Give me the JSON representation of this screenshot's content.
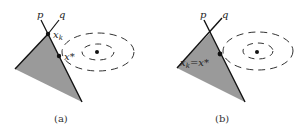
{
  "panels": [
    {
      "caption": "(a)",
      "labels": {
        "p": "p",
        "q": "q",
        "xk": "x",
        "xk_sub": "k",
        "xstar": "x*"
      }
    },
    {
      "caption": "(b)",
      "labels": {
        "p": "p",
        "q": "q",
        "xk_eq": "x",
        "xk_sub": "k",
        "eq_rest": "=x*"
      }
    }
  ],
  "colors": {
    "fill": "#9a9a9a",
    "stroke": "#111111",
    "dash": "#333333"
  }
}
